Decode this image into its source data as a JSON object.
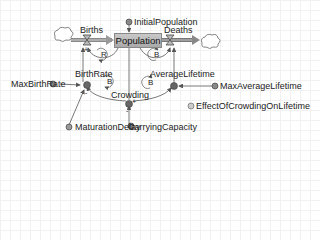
{
  "diagram": {
    "stock": {
      "label": "Population"
    },
    "flows": [
      {
        "id": "births",
        "label": "Births"
      },
      {
        "id": "deaths",
        "label": "Deaths"
      }
    ],
    "auxiliaries": [
      {
        "id": "birth_rate",
        "label": "BirthRate"
      },
      {
        "id": "average_lifetime",
        "label": "AverageLifetime"
      },
      {
        "id": "crowding",
        "label": "Crowding"
      }
    ],
    "parameters": [
      {
        "id": "initial_population",
        "label": "InitialPopulation"
      },
      {
        "id": "max_birth_rate",
        "label": "MaxBirthRate"
      },
      {
        "id": "max_average_lifetime",
        "label": "MaxAverageLifetime"
      },
      {
        "id": "maturation_delay",
        "label": "MaturationDelay"
      },
      {
        "id": "carrying_capacity",
        "label": "CarryingCapacity"
      }
    ],
    "table_functions": [
      {
        "id": "effect_of_crowding",
        "label": "EffectOfCrowdingOnLifetime"
      }
    ],
    "loops": [
      {
        "id": "loop_births",
        "label": "R"
      },
      {
        "id": "loop_deaths",
        "label": "B"
      },
      {
        "id": "loop_birthrate",
        "label": "B"
      },
      {
        "id": "loop_crowding",
        "label": "B"
      }
    ],
    "polarity": {
      "plus": "+",
      "minus": "-"
    },
    "colors": {
      "stock_fill": "#b3b3b3",
      "flow_pipe": "#7f7f7f",
      "aux_dot": "#555555",
      "link": "#555555",
      "grid": "#f1f1f1"
    }
  }
}
